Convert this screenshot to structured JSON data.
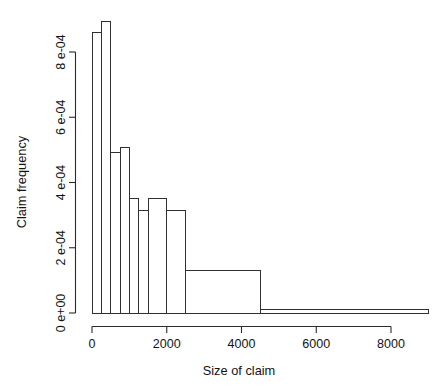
{
  "chart_data": {
    "type": "bar",
    "title": "",
    "subtitle": "",
    "xlabel": "Size of claim",
    "ylabel": "Claim frequency",
    "xlim": [
      0,
      9000
    ],
    "ylim": [
      0,
      0.000905
    ],
    "grid": false,
    "legend": null,
    "legend_position": "none",
    "note": "Histogram (R base graphics style) of claim sizes; density on y-axis, unequal bin widths in the right tail.",
    "xticks": [
      0,
      2000,
      4000,
      6000,
      8000
    ],
    "xtick_labels": [
      "0",
      "2000",
      "4000",
      "6000",
      "8000"
    ],
    "yticks": [
      0.0,
      0.0002,
      0.0004,
      0.0006,
      0.0008
    ],
    "ytick_labels": [
      "0 e+00",
      "2 e-04",
      "4 e-04",
      "6 e-04",
      "8 e-04"
    ],
    "bins": [
      {
        "x0": 0,
        "x1": 250,
        "value": 0.000859
      },
      {
        "x0": 250,
        "x1": 500,
        "value": 0.000893
      },
      {
        "x0": 500,
        "x1": 750,
        "value": 0.000491
      },
      {
        "x0": 750,
        "x1": 1000,
        "value": 0.000506
      },
      {
        "x0": 1000,
        "x1": 1250,
        "value": 0.00035
      },
      {
        "x0": 1250,
        "x1": 1500,
        "value": 0.000313
      },
      {
        "x0": 1500,
        "x1": 2000,
        "value": 0.00035
      },
      {
        "x0": 2000,
        "x1": 2500,
        "value": 0.000313
      },
      {
        "x0": 2500,
        "x1": 4500,
        "value": 0.000129
      },
      {
        "x0": 4500,
        "x1": 9000,
        "value": 1.2e-05
      }
    ],
    "categories": [
      "0-250",
      "250-500",
      "500-750",
      "750-1000",
      "1000-1250",
      "1250-1500",
      "1500-2000",
      "2000-2500",
      "2500-4500",
      "4500-9000"
    ],
    "values": [
      0.000859,
      0.000893,
      0.000491,
      0.000506,
      0.00035,
      0.000313,
      0.00035,
      0.000313,
      0.000129,
      1.2e-05
    ]
  },
  "style": {
    "axis_color": "#2b2b2b",
    "bar_stroke": "#303030",
    "bar_fill": "#ffffff",
    "background": "#ffffff",
    "text_color": "#131313"
  }
}
